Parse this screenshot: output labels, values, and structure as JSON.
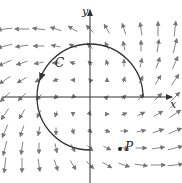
{
  "diagram": {
    "labels": {
      "x_axis": "x",
      "y_axis": "y",
      "curve": "C",
      "point": "P"
    },
    "origin_px": [
      90,
      97
    ],
    "grid": {
      "spacing_px": 17,
      "cols": [
        -5,
        -4,
        -3,
        -2,
        -1,
        0,
        1,
        2,
        3,
        4,
        5
      ],
      "rows": [
        -4,
        -3,
        -2,
        -1,
        0,
        1,
        2,
        3,
        4
      ]
    },
    "field": {
      "fx": "x - y",
      "fy": "x + y",
      "max_len_px": 15,
      "min_len_px": 3
    },
    "curve": {
      "type": "arc",
      "center_px": [
        90,
        97
      ],
      "radius_px": 53,
      "start_deg": 0,
      "end_deg": 270,
      "direction": "counterclockwise"
    },
    "point_px": [
      120,
      149
    ],
    "colors": {
      "axis": "#333333",
      "arrow": "#777777",
      "curve": "#333333",
      "text": "#222222"
    }
  }
}
